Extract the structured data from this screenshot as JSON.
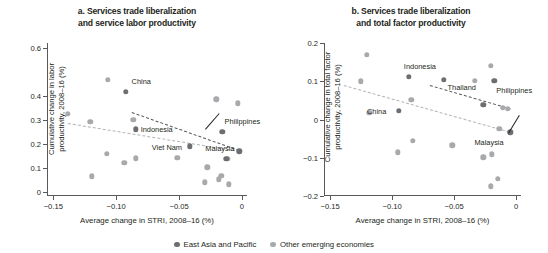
{
  "figure": {
    "legend": [
      {
        "key": "eap",
        "label": "East Asia and Pacific",
        "color": "#6d6e71"
      },
      {
        "key": "other",
        "label": "Other emerging economies",
        "color": "#a7a9ac"
      }
    ]
  },
  "chart_data": [
    {
      "id": "panel-a",
      "type": "scatter",
      "title_line1": "a. Services trade liberalization",
      "title_line2": "and service labor productivity",
      "xlabel": "Average change in STRI, 2008–16 (%)",
      "ylabel_line1": "Cumulative change in labor",
      "ylabel_line2": "productivity, 2008–16 (%)",
      "xlim": [
        -0.155,
        0.004
      ],
      "ylim": [
        -0.015,
        0.62
      ],
      "xticks": [
        -0.15,
        -0.1,
        -0.05,
        0
      ],
      "xticklabels": [
        "−0.15",
        "−0.10",
        "−0.05",
        "0"
      ],
      "yticks": [
        0,
        0.1,
        0.2,
        0.3,
        0.4,
        0.6
      ],
      "yticklabels": [
        "0",
        "0.1",
        "0.2",
        "0.3",
        "0.4",
        "0.6"
      ],
      "grid": false,
      "series": [
        {
          "name": "East Asia and Pacific",
          "key": "eap",
          "points": [
            {
              "x": -0.0925,
              "y": 0.417,
              "label": "China",
              "label_dx": 6,
              "label_dy": -11
            },
            {
              "x": -0.0845,
              "y": 0.262,
              "label": "Indonesia",
              "label_dx": 5,
              "label_dy": -0.5
            },
            {
              "x": -0.0415,
              "y": 0.191,
              "label": "Viet Nam",
              "label_dx": -38,
              "label_dy": 1
            },
            {
              "x": -0.0155,
              "y": 0.251,
              "label": "Philippines",
              "label_dx": 2,
              "label_dy": -11
            },
            {
              "x": -0.0125,
              "y": 0.139,
              "label": "Malaysia",
              "label_dx": -21,
              "label_dy": -11
            },
            {
              "x": -0.0022,
              "y": 0.17,
              "label": "",
              "label_dx": 0,
              "label_dy": 0
            }
          ]
        },
        {
          "name": "Other emerging economies",
          "key": "other",
          "points": [
            {
              "x": -0.1065,
              "y": 0.466
            },
            {
              "x": -0.1385,
              "y": 0.325
            },
            {
              "x": -0.1205,
              "y": 0.293
            },
            {
              "x": -0.0865,
              "y": 0.3
            },
            {
              "x": -0.0205,
              "y": 0.387
            },
            {
              "x": -0.0035,
              "y": 0.37
            },
            {
              "x": -0.1075,
              "y": 0.159
            },
            {
              "x": -0.0935,
              "y": 0.123
            },
            {
              "x": -0.0845,
              "y": 0.141
            },
            {
              "x": -0.0515,
              "y": 0.144
            },
            {
              "x": -0.1195,
              "y": 0.067
            },
            {
              "x": -0.0275,
              "y": 0.104
            },
            {
              "x": -0.0295,
              "y": 0.042
            },
            {
              "x": -0.0185,
              "y": 0.055
            },
            {
              "x": -0.0165,
              "y": 0.068
            },
            {
              "x": -0.0105,
              "y": 0.033
            },
            {
              "x": -0.0115,
              "y": 0.139
            }
          ]
        }
      ],
      "trendlines": [
        {
          "key": "eap",
          "x1": -0.0875,
          "y1": 0.334,
          "x2": -0.0022,
          "y2": 0.176
        },
        {
          "key": "other",
          "x1": -0.1385,
          "y1": 0.287,
          "x2": -0.0022,
          "y2": 0.171
        }
      ]
    },
    {
      "id": "panel-b",
      "type": "scatter",
      "title_line1": "b. Services trade liberalization",
      "title_line2": "and total factor productivity",
      "xlabel": "Average change in STRI, 2008–16 (%)",
      "ylabel_line1": "Cumulative change in total factor",
      "ylabel_line2": "productivity, 2008–16 (%)",
      "xlim": [
        -0.155,
        0.004
      ],
      "ylim": [
        -0.2,
        0.2
      ],
      "xticks": [
        -0.15,
        -0.1,
        -0.05,
        0
      ],
      "xticklabels": [
        "−0.15",
        "−0.10",
        "−0.05",
        "0"
      ],
      "yticks": [
        -0.2,
        -0.1,
        0,
        0.1,
        0.2
      ],
      "yticklabels": [
        "−0.2",
        "−0.1",
        "0",
        "0.1",
        "0.2"
      ],
      "grid": false,
      "series": [
        {
          "name": "East Asia and Pacific",
          "key": "eap",
          "points": [
            {
              "x": -0.0865,
              "y": 0.111,
              "label": "Indonesia",
              "label_dx": -5,
              "label_dy": -11
            },
            {
              "x": -0.0945,
              "y": 0.023,
              "label": "China",
              "label_dx": -32,
              "label_dy": 0
            },
            {
              "x": -0.0585,
              "y": 0.103,
              "label": "Thailand",
              "label_dx": 4,
              "label_dy": 7
            },
            {
              "x": -0.0175,
              "y": 0.101,
              "label": "Philippines",
              "label_dx": 2,
              "label_dy": 9
            },
            {
              "x": -0.0045,
              "y": -0.033,
              "label": "Malaysia",
              "label_dx": -36,
              "label_dy": 10
            },
            {
              "x": -0.0265,
              "y": 0.038,
              "label": "",
              "label_dx": 0,
              "label_dy": 0
            }
          ]
        },
        {
          "name": "Other emerging economies",
          "key": "other",
          "points": [
            {
              "x": -0.1205,
              "y": 0.169
            },
            {
              "x": -0.1255,
              "y": 0.1
            },
            {
              "x": -0.0205,
              "y": 0.141
            },
            {
              "x": -0.0335,
              "y": 0.101
            },
            {
              "x": -0.0845,
              "y": 0.052
            },
            {
              "x": -0.1185,
              "y": 0.017
            },
            {
              "x": -0.0105,
              "y": 0.03
            },
            {
              "x": -0.0065,
              "y": 0.028
            },
            {
              "x": -0.0835,
              "y": -0.055
            },
            {
              "x": -0.0955,
              "y": -0.086
            },
            {
              "x": -0.0515,
              "y": -0.067
            },
            {
              "x": -0.0135,
              "y": -0.024
            },
            {
              "x": -0.0265,
              "y": -0.099
            },
            {
              "x": -0.0195,
              "y": -0.091
            },
            {
              "x": -0.0205,
              "y": -0.175
            },
            {
              "x": -0.0145,
              "y": -0.155
            }
          ]
        }
      ],
      "trendlines": [
        {
          "key": "eap",
          "x1": -0.0695,
          "y1": 0.09,
          "x2": -0.0045,
          "y2": 0.029
        },
        {
          "key": "other",
          "x1": -0.1385,
          "y1": 0.091,
          "x2": -0.0045,
          "y2": -0.031
        }
      ]
    }
  ]
}
